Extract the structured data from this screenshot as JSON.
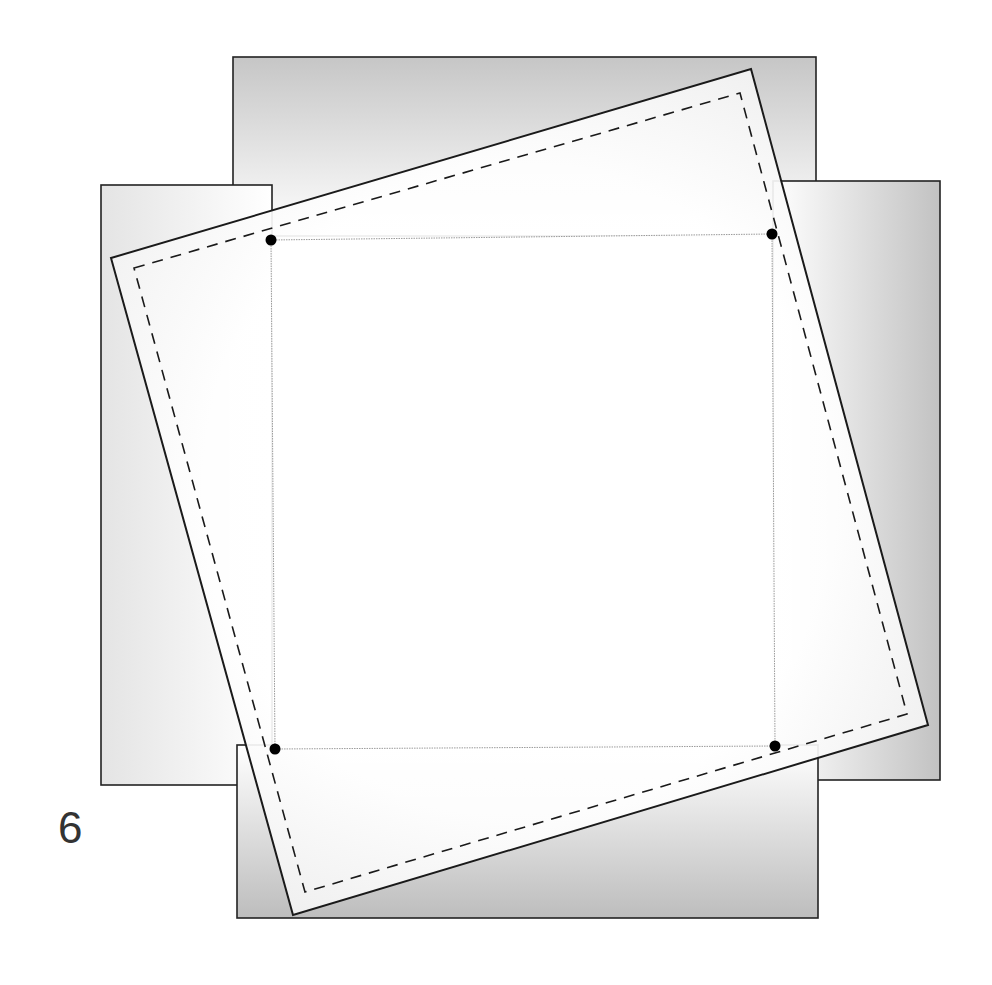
{
  "figure": {
    "label": "6"
  },
  "colors": {
    "stroke": "#222222",
    "thin_stroke": "#9a9a9a",
    "dot": "#000000",
    "flap_dark": "#c4c4c4",
    "flap_light": "#ffffff",
    "rotated_fill": "#f4f4f4"
  },
  "shapes": {
    "top_flap": {
      "x": 233,
      "y": 57,
      "w": 583,
      "h": 179
    },
    "left_flap": {
      "x": 101,
      "y": 185,
      "w": 171,
      "h": 600
    },
    "right_flap": {
      "x": 773,
      "y": 181,
      "w": 167,
      "h": 599
    },
    "bottom_flap": {
      "x": 237,
      "y": 745,
      "w": 581,
      "h": 173
    },
    "center_square": [
      [
        271,
        240
      ],
      [
        772,
        234
      ],
      [
        775,
        746
      ],
      [
        275,
        749
      ]
    ],
    "rotated_square": [
      [
        111,
        258
      ],
      [
        751,
        69
      ],
      [
        928,
        725
      ],
      [
        293,
        915
      ]
    ],
    "dashed_square": [
      [
        134,
        268
      ],
      [
        740,
        93
      ],
      [
        907,
        714
      ],
      [
        305,
        892
      ]
    ],
    "corner_dots": [
      [
        271,
        240
      ],
      [
        772,
        234
      ],
      [
        775,
        746
      ],
      [
        275,
        749
      ]
    ]
  }
}
